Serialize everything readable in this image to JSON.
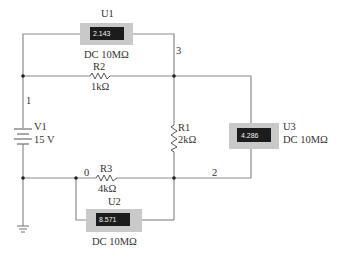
{
  "circuit": {
    "source": {
      "name": "V1",
      "value": "15 V"
    },
    "resistors": [
      {
        "name": "R1",
        "value": "2kΩ"
      },
      {
        "name": "R2",
        "value": "1kΩ"
      },
      {
        "name": "R3",
        "value": "4kΩ"
      }
    ],
    "meters": [
      {
        "name": "U1",
        "reading": "2.143",
        "mode": "DC 10MΩ"
      },
      {
        "name": "U2",
        "reading": "8.571",
        "mode": "DC 10MΩ"
      },
      {
        "name": "U3",
        "reading": "4.286",
        "mode": "DC 10MΩ"
      }
    ],
    "nodes": {
      "n0": "0",
      "n1": "1",
      "n2": "2",
      "n3": "3"
    }
  },
  "colors": {
    "wire": "#8c8c8c",
    "meter_body": "#c9c9c9",
    "meter_display": "#1c1c1c"
  }
}
